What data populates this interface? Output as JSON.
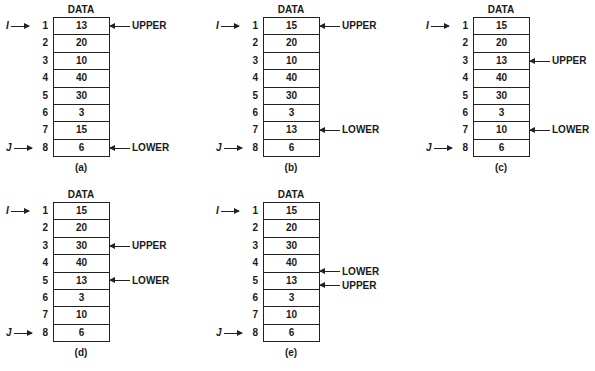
{
  "panels": [
    {
      "caption": "(a)",
      "title": "DATA",
      "values": [
        "13",
        "20",
        "10",
        "40",
        "30",
        "3",
        "15",
        "6"
      ],
      "upper_row": 1,
      "lower_row": 8
    },
    {
      "caption": "(b)",
      "title": "DATA",
      "values": [
        "15",
        "20",
        "10",
        "40",
        "30",
        "3",
        "13",
        "6"
      ],
      "upper_row": 1,
      "lower_row": 7
    },
    {
      "caption": "(c)",
      "title": "DATA",
      "values": [
        "15",
        "20",
        "13",
        "40",
        "30",
        "3",
        "10",
        "6"
      ],
      "upper_row": 3,
      "lower_row": 7
    },
    {
      "caption": "(d)",
      "title": "DATA",
      "values": [
        "15",
        "20",
        "30",
        "40",
        "13",
        "3",
        "10",
        "6"
      ],
      "upper_row": 3,
      "lower_row": 5
    },
    {
      "caption": "(e)",
      "title": "DATA",
      "values": [
        "15",
        "20",
        "30",
        "40",
        "13",
        "3",
        "10",
        "6"
      ],
      "upper_row": 5,
      "lower_row": 5
    }
  ],
  "indices": [
    "1",
    "2",
    "3",
    "4",
    "5",
    "6",
    "7",
    "8"
  ],
  "labels": {
    "upper": "UPPER",
    "lower": "LOWER",
    "i": "I",
    "j": "J"
  }
}
